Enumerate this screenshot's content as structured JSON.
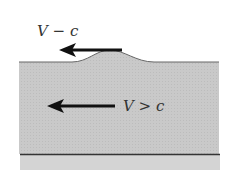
{
  "diagram": {
    "labels": {
      "surface_speed": "V − c",
      "flow_condition": "V > c"
    },
    "colors": {
      "water": "#c8c8c8",
      "bed": "#d2d2d2",
      "line": "#555555",
      "arrow": "#111111"
    }
  }
}
